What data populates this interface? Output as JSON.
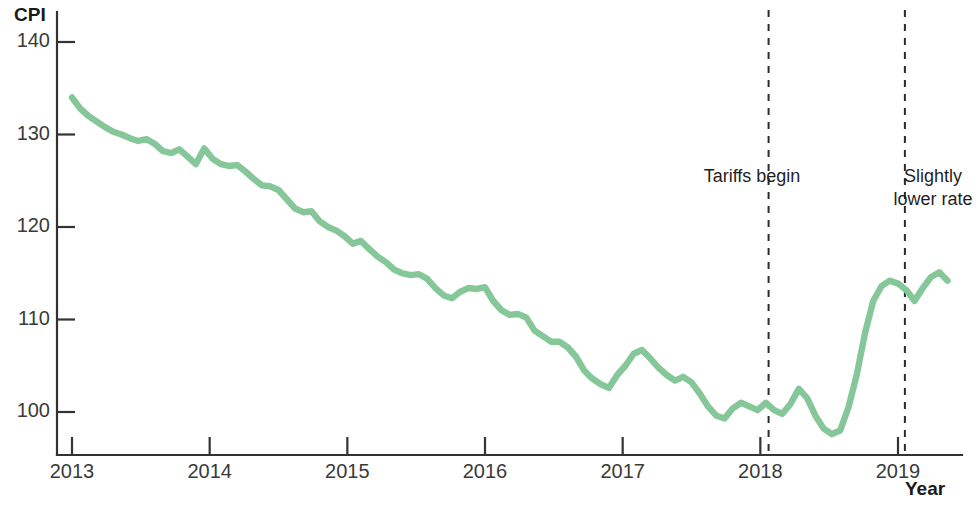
{
  "chart_data": {
    "type": "line",
    "title": "",
    "xlabel": "Year",
    "ylabel": "CPI",
    "xlim": [
      2013,
      2019.38
    ],
    "ylim": [
      95.5,
      141
    ],
    "grid": false,
    "legend": null,
    "line_color": "#86c79a",
    "y_ticks": [
      100,
      110,
      120,
      130,
      140
    ],
    "x_ticks": [
      2013,
      2014,
      2015,
      2016,
      2017,
      2018,
      2019
    ],
    "x_tick_labels": [
      "2013",
      "2014",
      "2015",
      "2016",
      "2017",
      "2018",
      "2019"
    ],
    "y_tick_labels": [
      "100",
      "110",
      "120",
      "130",
      "140"
    ],
    "series": [
      {
        "name": "CPI",
        "x": [
          2013.0,
          2013.06,
          2013.12,
          2013.18,
          2013.24,
          2013.3,
          2013.36,
          2013.42,
          2013.48,
          2013.54,
          2013.6,
          2013.66,
          2013.72,
          2013.78,
          2013.84,
          2013.9,
          2013.96,
          2014.02,
          2014.08,
          2014.14,
          2014.2,
          2014.26,
          2014.32,
          2014.38,
          2014.44,
          2014.5,
          2014.56,
          2014.62,
          2014.68,
          2014.74,
          2014.8,
          2014.86,
          2014.92,
          2014.98,
          2015.04,
          2015.1,
          2015.16,
          2015.22,
          2015.28,
          2015.34,
          2015.4,
          2015.46,
          2015.52,
          2015.58,
          2015.64,
          2015.7,
          2015.76,
          2015.82,
          2015.88,
          2015.94,
          2016.0,
          2016.06,
          2016.12,
          2016.18,
          2016.24,
          2016.3,
          2016.36,
          2016.42,
          2016.48,
          2016.54,
          2016.6,
          2016.66,
          2016.72,
          2016.78,
          2016.84,
          2016.9,
          2016.96,
          2017.02,
          2017.08,
          2017.14,
          2017.2,
          2017.26,
          2017.32,
          2017.38,
          2017.44,
          2017.5,
          2017.56,
          2017.62,
          2017.68,
          2017.74,
          2017.8,
          2017.86,
          2017.92,
          2017.98,
          2018.04,
          2018.1,
          2018.16,
          2018.22,
          2018.28,
          2018.34,
          2018.4,
          2018.46,
          2018.52,
          2018.58,
          2018.64,
          2018.7,
          2018.76,
          2018.82,
          2018.88,
          2018.94,
          2019.0,
          2019.06,
          2019.12,
          2019.18,
          2019.24,
          2019.3,
          2019.36
        ],
        "values": [
          134.0,
          132.8,
          132.0,
          131.4,
          130.8,
          130.3,
          130.0,
          129.6,
          129.3,
          129.5,
          129.0,
          128.2,
          128.0,
          128.4,
          127.6,
          126.8,
          128.5,
          127.4,
          126.8,
          126.6,
          126.7,
          126.0,
          125.2,
          124.5,
          124.4,
          124.0,
          123.0,
          122.0,
          121.6,
          121.7,
          120.6,
          120.0,
          119.6,
          119.0,
          118.2,
          118.5,
          117.6,
          116.8,
          116.2,
          115.4,
          115.0,
          114.8,
          114.9,
          114.4,
          113.4,
          112.6,
          112.3,
          113.0,
          113.4,
          113.3,
          113.5,
          112.0,
          111.0,
          110.5,
          110.6,
          110.2,
          108.8,
          108.2,
          107.6,
          107.6,
          107.0,
          106.0,
          104.5,
          103.6,
          103.0,
          102.6,
          104.0,
          105.0,
          106.3,
          106.7,
          105.8,
          104.8,
          104.0,
          103.4,
          103.8,
          103.2,
          102.0,
          100.6,
          99.6,
          99.3,
          100.4,
          101.0,
          100.6,
          100.2,
          101.0,
          100.2,
          99.8,
          100.9,
          102.5,
          101.5,
          99.6,
          98.2,
          97.6,
          98.0,
          100.5,
          104.0,
          108.5,
          112.0,
          113.6,
          114.2,
          113.9,
          113.2,
          112.0,
          113.4,
          114.6,
          115.1,
          114.2
        ]
      }
    ],
    "annotations": [
      {
        "name": "tariffs-begin",
        "text": "Tariffs begin",
        "x": 2018.06,
        "marker": "dashed-vertical-line"
      },
      {
        "name": "slightly-lower-rate",
        "text": "Slightly\nlower rate",
        "x": 2019.05,
        "marker": "dashed-vertical-line"
      }
    ]
  },
  "labels": {
    "y_axis_title": "CPI",
    "x_axis_title": "Year"
  },
  "annotations": {
    "tariffs_begin": "Tariffs begin",
    "slightly_lower_rate": "Slightly\nlower rate"
  },
  "colors": {
    "line": "#86c79a",
    "axis": "#333333",
    "text": "#2b2b2b",
    "dashed": "#2b2b2b"
  }
}
